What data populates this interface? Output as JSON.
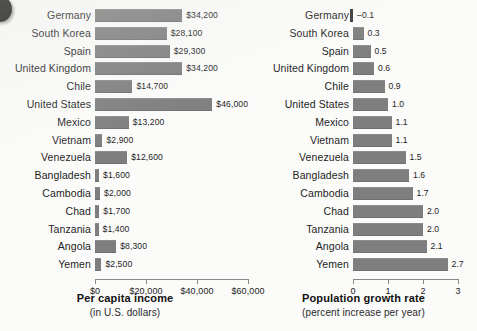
{
  "figure": {
    "background_color": "#fbfbfa",
    "bar_color": "#7e7e7e",
    "negative_bar_color": "#3a3a3a",
    "axis_color": "#8a8a8a"
  },
  "categories": [
    "Germany",
    "South Korea",
    "Spain",
    "United Kingdom",
    "Chile",
    "United States",
    "Mexico",
    "Vietnam",
    "Venezuela",
    "Bangladesh",
    "Cambodia",
    "Chad",
    "Tanzania",
    "Angola",
    "Yemen"
  ],
  "chart_data": [
    {
      "type": "bar",
      "orientation": "horizontal",
      "title": "Per capita income",
      "subtitle": "(in U.S. dollars)",
      "xlabel": "Per capita income",
      "ylabel": "",
      "xlim": [
        0,
        60000
      ],
      "grid": false,
      "legend": "none",
      "tick_values": [
        0,
        20000,
        40000,
        60000
      ],
      "tick_labels": [
        "$0",
        "$20,000",
        "$40,000",
        "$60,000"
      ],
      "categories": [
        "Germany",
        "South Korea",
        "Spain",
        "United Kingdom",
        "Chile",
        "United States",
        "Mexico",
        "Vietnam",
        "Venezuela",
        "Bangladesh",
        "Cambodia",
        "Chad",
        "Tanzania",
        "Angola",
        "Yemen"
      ],
      "values": [
        34200,
        28100,
        29300,
        34200,
        14700,
        46000,
        13200,
        2900,
        12600,
        1600,
        2000,
        1700,
        1400,
        8300,
        2500
      ],
      "data_labels": [
        "$34,200",
        "$28,100",
        "$29,300",
        "$34,200",
        "$14,700",
        "$46,000",
        "$13,200",
        "$2,900",
        "$12,600",
        "$1,600",
        "$2,000",
        "$1,700",
        "$1,400",
        "$8,300",
        "$2,500"
      ]
    },
    {
      "type": "bar",
      "orientation": "horizontal",
      "title": "Population growth rate",
      "subtitle": "(percent increase per year)",
      "xlabel": "Population growth rate",
      "ylabel": "",
      "xlim": [
        -0.2,
        3
      ],
      "grid": false,
      "legend": "none",
      "tick_values": [
        0,
        1,
        2,
        3
      ],
      "tick_labels": [
        "0",
        "1",
        "2",
        "3"
      ],
      "categories": [
        "Germany",
        "South Korea",
        "Spain",
        "United Kingdom",
        "Chile",
        "United States",
        "Mexico",
        "Vietnam",
        "Venezuela",
        "Bangladesh",
        "Cambodia",
        "Chad",
        "Tanzania",
        "Angola",
        "Yemen"
      ],
      "values": [
        -0.1,
        0.3,
        0.5,
        0.6,
        0.9,
        1.0,
        1.1,
        1.1,
        1.5,
        1.6,
        1.7,
        2.0,
        2.0,
        2.1,
        2.7
      ],
      "data_labels": [
        "–0.1",
        "0.3",
        "0.5",
        "0.6",
        "0.9",
        "1.0",
        "1.1",
        "1.1",
        "1.5",
        "1.6",
        "1.7",
        "2.0",
        "2.0",
        "2.1",
        "2.7"
      ]
    }
  ]
}
